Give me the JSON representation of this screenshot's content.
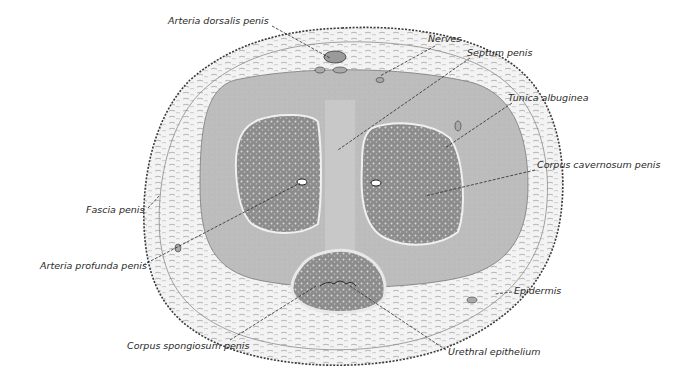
{
  "figure": {
    "colors": {
      "background": "#ffffff",
      "outer_tissue": "#f1f1f1",
      "tunica": "#b9b9b9",
      "erectile_tissue": "#8c8c8c",
      "outline": "#3a3a3a",
      "label_text": "#2a2a2a"
    }
  },
  "labels": [
    {
      "id": "arteria-dorsalis-penis",
      "text": "Arteria dorsalis penis",
      "x": 168,
      "y": 20
    },
    {
      "id": "nerves",
      "text": "Nerves",
      "x": 428,
      "y": 39
    },
    {
      "id": "septum-penis",
      "text": "Septum penis",
      "x": 467,
      "y": 53
    },
    {
      "id": "tunica-albuginea",
      "text": "Tunica albuginea",
      "x": 508,
      "y": 97
    },
    {
      "id": "corpus-cavernosum-penis",
      "text": "Corpus cavernosum penis",
      "x": 537,
      "y": 164
    },
    {
      "id": "fascia-penis",
      "text": "Fascia penis",
      "x": 86,
      "y": 205
    },
    {
      "id": "arteria-profunda-penis",
      "text": "Arteria profunda penis",
      "x": 40,
      "y": 262
    },
    {
      "id": "epidermis",
      "text": "Epidermis",
      "x": 514,
      "y": 287
    },
    {
      "id": "corpus-spongiosum-penis",
      "text": "Corpus spongiosum penis",
      "x": 127,
      "y": 342
    },
    {
      "id": "urethral-epithelium",
      "text": "Urethral epithelium",
      "x": 448,
      "y": 348
    }
  ]
}
